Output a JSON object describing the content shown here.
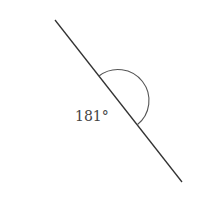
{
  "diagram": {
    "type": "angle",
    "label": "181°",
    "line": {
      "x1": 55,
      "y1": 20,
      "x2": 182,
      "y2": 182
    },
    "arc": {
      "start": [
        99,
        76
      ],
      "end": [
        137,
        125
      ],
      "radius": 30
    },
    "colors": {
      "line": "#333333",
      "arc": "#555555",
      "text": "#444444"
    }
  }
}
